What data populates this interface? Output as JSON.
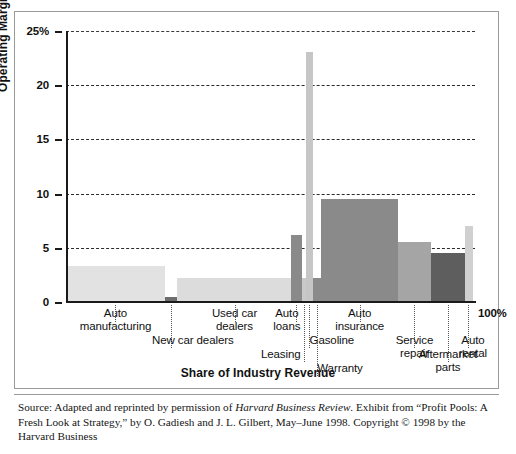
{
  "figure": {
    "y_axis_title": "Operating Margin",
    "x_axis_title": "Share of Industry Revenue",
    "right_end_label": "100%",
    "source_line1_a": "Source: Adapted and reprinted by permission of ",
    "source_line1_b": "Harvard Business Review",
    "source_line1_c": ". Exhibit from “Profit Pools: A Fresh",
    "source_line2": "Look at Strategy,” by O. Gadiesh and J. L. Gilbert, May–June 1998. Copyright © 1998 by the Harvard Business"
  },
  "chart_data": {
    "type": "bar",
    "title": "",
    "subtitle": "",
    "xlabel": "Share of Industry Revenue",
    "ylabel": "Operating Margin",
    "ylim": [
      0,
      25
    ],
    "yticks": [
      0,
      5,
      10,
      15,
      20,
      25
    ],
    "ytick_labels": [
      "0",
      "5",
      "10",
      "15",
      "20",
      "25%"
    ],
    "xlim": [
      0,
      100
    ],
    "xlim_labels": [
      "",
      "100%"
    ],
    "grid": true,
    "grid_axis": "y",
    "legend": "none",
    "note": "Variable-width (Marimekko / profit-pool) bar chart: bar width = share of industry revenue, bar height = operating margin.",
    "categories": [
      {
        "label": "Auto\nmanufacturing",
        "x_start": 0.0,
        "x_end": 24.2,
        "width": 24.2,
        "value": 3.3,
        "color": "#e2e2e2"
      },
      {
        "label": "New car dealers",
        "x_start": 24.2,
        "x_end": 27.2,
        "width": 3.0,
        "value": 0.5,
        "color": "#6d6d6d"
      },
      {
        "label": "Used car\ndealers",
        "x_start": 27.2,
        "x_end": 55.1,
        "width": 27.9,
        "value": 2.2,
        "color": "#dcdcdc"
      },
      {
        "label": "Auto\nloans",
        "x_start": 55.1,
        "x_end": 57.6,
        "width": 2.5,
        "value": 6.2,
        "color": "#8a8a8a"
      },
      {
        "label": "Leasing",
        "x_start": 57.6,
        "x_end": 58.6,
        "width": 1.0,
        "value": 2.2,
        "color": "#c9c9c9"
      },
      {
        "label": "Warranty",
        "x_start": 58.6,
        "x_end": 60.4,
        "width": 1.8,
        "value": 23.1,
        "color": "#c6c6c6"
      },
      {
        "label": "Gasoline",
        "x_start": 60.4,
        "x_end": 62.3,
        "width": 1.9,
        "value": 2.2,
        "color": "#8a8a8a"
      },
      {
        "label": "Auto\ninsurance",
        "x_start": 62.3,
        "x_end": 81.2,
        "width": 18.9,
        "value": 9.5,
        "color": "#8a8a8a"
      },
      {
        "label": "Service\nrepair",
        "x_start": 81.2,
        "x_end": 89.2,
        "width": 8.0,
        "value": 5.5,
        "color": "#a5a5a5"
      },
      {
        "label": "Aftermarket\nparts",
        "x_start": 89.2,
        "x_end": 97.5,
        "width": 8.3,
        "value": 4.5,
        "color": "#5e5e5e"
      },
      {
        "label": "Auto\nrental",
        "x_start": 97.5,
        "x_end": 99.5,
        "width": 2.0,
        "value": 7.0,
        "color": "#d0d0d0"
      }
    ],
    "callouts": [
      {
        "name": "Auto manufacturing",
        "text": "Auto\nmanufacturing",
        "tick_x": 12.1,
        "label_x": 12.1,
        "row": 0
      },
      {
        "name": "New car dealers",
        "text": "New car dealers",
        "tick_x": 25.7,
        "label_x": 31.0,
        "row": 1
      },
      {
        "name": "Used car dealers",
        "text": "Used car\ndealers",
        "tick_x": 41.2,
        "label_x": 41.2,
        "row": 0
      },
      {
        "name": "Auto loans",
        "text": "Auto\nloans",
        "tick_x": 56.3,
        "label_x": 54.0,
        "row": 0
      },
      {
        "name": "Leasing",
        "text": "Leasing",
        "tick_x": 58.1,
        "label_x": 52.5,
        "row": 2
      },
      {
        "name": "Gasoline",
        "text": "Gasoline",
        "tick_x": 59.5,
        "label_x": 65.0,
        "row": 1
      },
      {
        "name": "Warranty",
        "text": "Warranty",
        "tick_x": 61.3,
        "label_x": 67.0,
        "row": 3
      },
      {
        "name": "Auto insurance",
        "text": "Auto\ninsurance",
        "tick_x": 71.8,
        "label_x": 71.8,
        "row": 0
      },
      {
        "name": "Service repair",
        "text": "Service\nrepair",
        "tick_x": 85.2,
        "label_x": 85.2,
        "row": 1
      },
      {
        "name": "Aftermarket parts",
        "text": "Aftermarket\nparts",
        "tick_x": 93.4,
        "label_x": 93.4,
        "row": 2
      },
      {
        "name": "Auto rental",
        "text": "Auto\nrental",
        "tick_x": 98.3,
        "label_x": 99.5,
        "row": 1
      }
    ]
  },
  "colors": {
    "axis": "#1a1a1a",
    "grid": "#2b2b2b",
    "frame": "#9a9a9a",
    "text": "#111111",
    "background": "#ffffff"
  }
}
